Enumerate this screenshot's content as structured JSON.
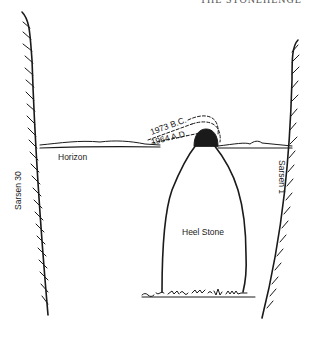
{
  "diagram": {
    "header_fragment": "THE STONEHENGE",
    "labels": {
      "left_stone": "Sarsen 30",
      "right_stone": "Sarsen 1",
      "horizon": "Horizon",
      "heel_stone": "Heel Stone",
      "sun_1973bc": "1973 B.C.",
      "sun_1964ad": "1964 A.D."
    },
    "colors": {
      "ink": "#1a1a1a",
      "background": "#ffffff"
    }
  }
}
